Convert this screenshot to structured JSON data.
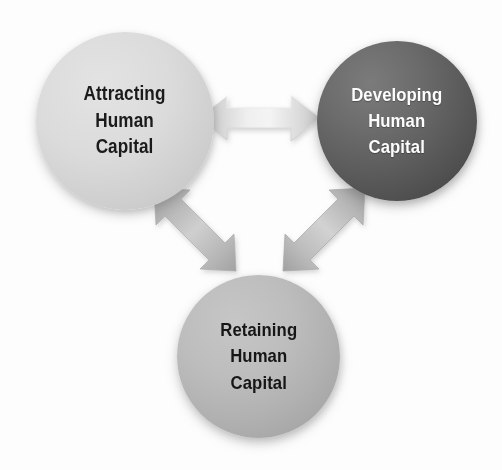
{
  "diagram": {
    "type": "cycle-triangle",
    "background_color": "#fdfdfd",
    "nodes": [
      {
        "id": "attracting",
        "label": "Attracting\nHuman\nCapital",
        "lines": [
          "Attracting",
          "Human",
          "Capital"
        ],
        "shape": "circle",
        "position": "top-left",
        "fill_color": "#d5d5d5",
        "text_color": "#1b1b1b"
      },
      {
        "id": "developing",
        "label": "Developing\nHuman\nCapital",
        "lines": [
          "Developing",
          "Human",
          "Capital"
        ],
        "shape": "circle",
        "position": "top-right",
        "fill_color": "#585858",
        "text_color": "#fdfdfd"
      },
      {
        "id": "retaining",
        "label": "Retaining\nHuman\nCapital",
        "lines": [
          "Retaining",
          "Human",
          "Capital"
        ],
        "shape": "circle",
        "position": "bottom-center",
        "fill_color": "#b4b4b4",
        "text_color": "#161616"
      }
    ],
    "connectors": [
      {
        "id": "attracting-developing",
        "from": "attracting",
        "to": "developing",
        "style": "double-headed-arrow",
        "orientation": "horizontal",
        "color": "#e6e6e6"
      },
      {
        "id": "attracting-retaining",
        "from": "attracting",
        "to": "retaining",
        "style": "double-headed-arrow",
        "orientation": "diagonal-down-right",
        "color": "#b9b9b9"
      },
      {
        "id": "developing-retaining",
        "from": "retaining",
        "to": "developing",
        "style": "double-headed-arrow",
        "orientation": "diagonal-up-right",
        "color": "#b9b9b9"
      }
    ]
  }
}
